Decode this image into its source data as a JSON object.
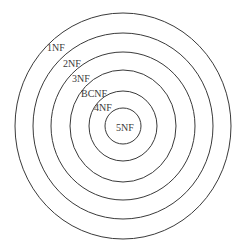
{
  "diagram": {
    "stroke_color": "#3a3a3a",
    "background": "#ffffff",
    "center": {
      "x": 123,
      "y": 126
    },
    "rings": [
      {
        "label": "1NF",
        "rx": 108,
        "ry": 113,
        "label_x": 47,
        "label_y": 51
      },
      {
        "label": "2NF",
        "rx": 90,
        "ry": 93,
        "label_x": 63,
        "label_y": 67
      },
      {
        "label": "3NF",
        "rx": 72,
        "ry": 74,
        "label_x": 72,
        "label_y": 82
      },
      {
        "label": "BCNF",
        "rx": 53,
        "ry": 56,
        "label_x": 81,
        "label_y": 97
      },
      {
        "label": "4NF",
        "rx": 34,
        "ry": 35,
        "label_x": 94,
        "label_y": 111
      },
      {
        "label": "5NF",
        "rx": 18,
        "ry": 18,
        "label_x": 116,
        "label_y": 131
      }
    ]
  }
}
